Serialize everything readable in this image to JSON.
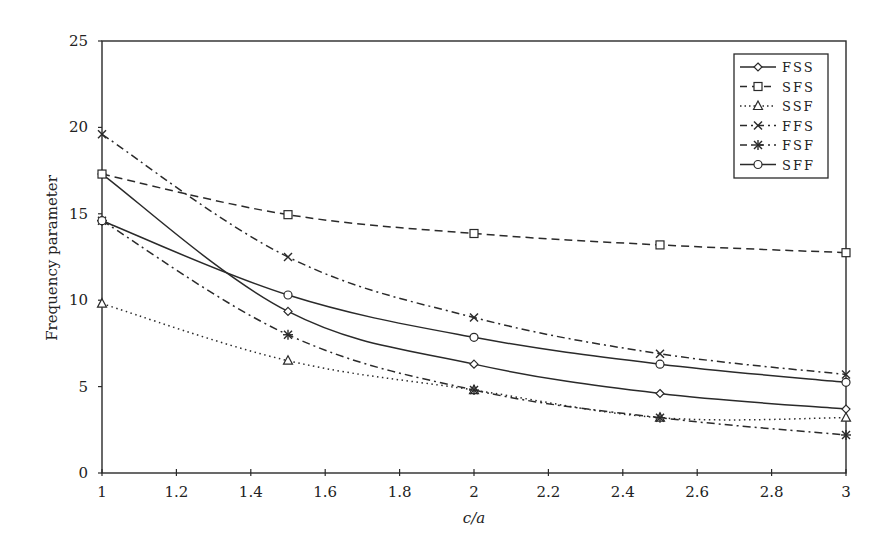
{
  "chart_data": {
    "type": "line",
    "title": "",
    "xlabel": "c/a",
    "ylabel": "Frequency parameter",
    "x": [
      1,
      1.5,
      2,
      2.5,
      3
    ],
    "xlim": [
      1,
      3
    ],
    "ylim": [
      0,
      25
    ],
    "xticks": [
      "1",
      "1.2",
      "1.4",
      "1.6",
      "1.8",
      "2",
      "2.2",
      "2.4",
      "2.6",
      "2.8",
      "3"
    ],
    "yticks": [
      "0",
      "5",
      "10",
      "15",
      "20",
      "25"
    ],
    "grid": false,
    "legend_position": "upper right (inside)",
    "series": [
      {
        "name": "FSS",
        "marker": "diamond",
        "line": "solid",
        "values": [
          17.3,
          9.35,
          6.3,
          4.6,
          3.7
        ]
      },
      {
        "name": "SFS",
        "marker": "square",
        "line": "dashed",
        "values": [
          17.3,
          14.95,
          13.86,
          13.2,
          12.75
        ]
      },
      {
        "name": "SSF",
        "marker": "triangle",
        "line": "dotted",
        "values": [
          9.8,
          6.5,
          4.8,
          3.2,
          3.2
        ]
      },
      {
        "name": "FFS",
        "marker": "x",
        "line": "dashdot",
        "values": [
          19.6,
          12.5,
          9.0,
          6.9,
          5.7
        ]
      },
      {
        "name": "FSF",
        "marker": "asterisk",
        "line": "dashdot",
        "values": [
          14.6,
          8.0,
          4.8,
          3.2,
          2.2
        ]
      },
      {
        "name": "SFF",
        "marker": "circle",
        "line": "solid",
        "values": [
          14.6,
          10.3,
          7.85,
          6.3,
          5.25
        ]
      }
    ]
  },
  "axes": {
    "xlabel": "c/a",
    "ylabel": "Frequency parameter"
  },
  "legend": {
    "items": [
      "FSS",
      "SFS",
      "SSF",
      "FFS",
      "FSF",
      "SFF"
    ]
  }
}
